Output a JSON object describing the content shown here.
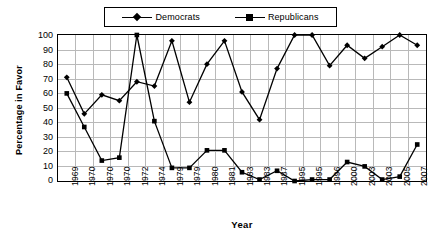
{
  "chart_data": {
    "type": "line",
    "title": "",
    "xlabel": "Year",
    "ylabel": "Percentage in Favor",
    "ylim": [
      0,
      100
    ],
    "ytick_step": 10,
    "yticks": [
      100,
      90,
      80,
      70,
      60,
      50,
      40,
      30,
      20,
      10,
      0
    ],
    "grid": true,
    "legend_position": "top-center",
    "categories": [
      "1969",
      "1970",
      "1970",
      "1970",
      "1972",
      "1974",
      "1979",
      "1979",
      "1980",
      "1981",
      "1983",
      "1983",
      "1987",
      "1995",
      "1995",
      "1996",
      "2000",
      "2003",
      "2003",
      "2005",
      "2007"
    ],
    "series": [
      {
        "name": "Democrats",
        "marker": "diamond",
        "color": "#000000",
        "values": [
          71,
          46,
          59,
          55,
          68,
          65,
          96,
          54,
          80,
          96,
          61,
          42,
          77,
          100,
          100,
          79,
          93,
          84,
          92,
          100,
          93
        ]
      },
      {
        "name": "Republicans",
        "marker": "square",
        "color": "#000000",
        "values": [
          60,
          37,
          14,
          16,
          100,
          41,
          9,
          9,
          21,
          21,
          6,
          1,
          7,
          0,
          1,
          1,
          13,
          10,
          1,
          3,
          25
        ]
      }
    ]
  },
  "legend": {
    "entries": [
      {
        "label": "Democrats"
      },
      {
        "label": "Republicans"
      }
    ]
  },
  "axes": {
    "x_title": "Year",
    "y_title": "Percentage in Favor"
  }
}
